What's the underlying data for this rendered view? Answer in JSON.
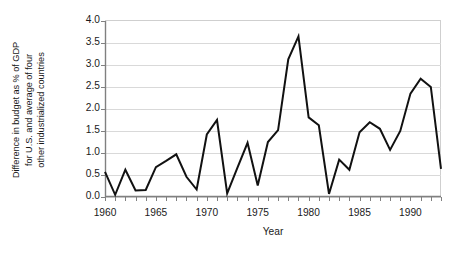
{
  "chart_data": {
    "type": "line",
    "title": "",
    "xlabel": "Year",
    "ylabel": "Difference in budget as % of GDP for U.S. and average of four other industrialized countries",
    "ylabel_lines": [
      "Difference in budget as % of GDP",
      "for U.S. and average of four",
      "other industrialized countries"
    ],
    "xlim": [
      1960,
      1993
    ],
    "ylim": [
      0.0,
      4.0
    ],
    "grid": "horizontal",
    "legend": "none",
    "y_ticks": [
      "0.0",
      "0.5",
      "1.0",
      "1.5",
      "2.0",
      "2.5",
      "3.0",
      "3.5",
      "4.0"
    ],
    "y_tick_values": [
      0.0,
      0.5,
      1.0,
      1.5,
      2.0,
      2.5,
      3.0,
      3.5,
      4.0
    ],
    "x_ticks": [
      "1960",
      "1965",
      "1970",
      "1975",
      "1980",
      "1985",
      "1990"
    ],
    "x_tick_values": [
      1960,
      1965,
      1970,
      1975,
      1980,
      1985,
      1990
    ],
    "x_minor_tick_interval": 1,
    "line_color": "#111111",
    "line_width": 2.0,
    "grid_color": "#d9d9d9",
    "axis_color": "#808080",
    "x": [
      1960,
      1961,
      1962,
      1963,
      1964,
      1965,
      1966,
      1967,
      1968,
      1969,
      1970,
      1971,
      1972,
      1973,
      1974,
      1975,
      1976,
      1977,
      1978,
      1979,
      1980,
      1981,
      1982,
      1983,
      1984,
      1985,
      1986,
      1987,
      1988,
      1989,
      1990,
      1991,
      1992,
      1993
    ],
    "values": [
      0.57,
      0.05,
      0.62,
      0.15,
      0.16,
      0.68,
      0.82,
      0.97,
      0.46,
      0.17,
      1.42,
      1.75,
      0.08,
      0.66,
      1.23,
      0.26,
      1.25,
      1.52,
      3.13,
      3.65,
      1.81,
      1.63,
      0.07,
      0.85,
      0.62,
      1.47,
      1.7,
      1.55,
      1.07,
      1.5,
      2.35,
      2.69,
      2.5,
      0.64
    ]
  }
}
